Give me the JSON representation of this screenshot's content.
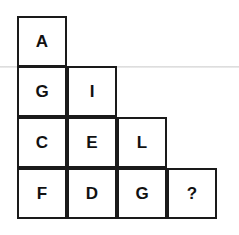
{
  "puzzle": {
    "rows": [
      [
        "A"
      ],
      [
        "G",
        "I"
      ],
      [
        "C",
        "E",
        "L"
      ],
      [
        "F",
        "D",
        "G",
        "?"
      ]
    ]
  }
}
